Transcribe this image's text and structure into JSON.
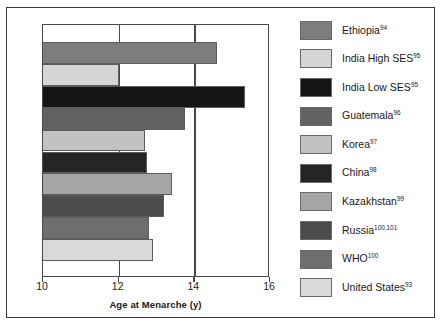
{
  "chart_data": {
    "type": "bar",
    "orientation": "horizontal",
    "title": "",
    "xlabel": "Age at Menarche (y)",
    "ylabel": "Country of Origin",
    "xlim": [
      10,
      16
    ],
    "xticks": [
      10,
      12,
      14,
      16
    ],
    "xtick_labels": [
      "10",
      "12",
      "14",
      "16"
    ],
    "grid": true,
    "grid_axis": "x",
    "legend_position": "right",
    "categories": [
      "Ethiopia",
      "India High SES",
      "India Low SES",
      "Guatemala",
      "Korea",
      "China",
      "Kazakhstan",
      "Russia",
      "WHO",
      "United States"
    ],
    "values": [
      14.6,
      12.0,
      15.35,
      13.75,
      12.7,
      12.75,
      13.4,
      13.2,
      12.8,
      12.9
    ],
    "colors": [
      "#7d7d7d",
      "#d6d6d6",
      "#151515",
      "#626262",
      "#c2c2c2",
      "#252525",
      "#a5a5a5",
      "#4c4c4c",
      "#6e6e6e",
      "#d9d9d9"
    ]
  },
  "axes": {
    "y_title": "Country of Origin",
    "x_title": "Age at Menarche (y)",
    "x_tick_labels": [
      "10",
      "12",
      "14",
      "16"
    ]
  },
  "legend": {
    "items": [
      {
        "label": "Ethiopia",
        "ref": "94",
        "color": "#7d7d7d"
      },
      {
        "label": "India High SES",
        "ref": "95",
        "color": "#d6d6d6"
      },
      {
        "label": "India Low SES",
        "ref": "95",
        "color": "#151515"
      },
      {
        "label": "Guatemala",
        "ref": "96",
        "color": "#626262"
      },
      {
        "label": "Korea",
        "ref": "97",
        "color": "#c2c2c2"
      },
      {
        "label": "China",
        "ref": "98",
        "color": "#252525"
      },
      {
        "label": "Kazakhstan",
        "ref": "99",
        "color": "#a5a5a5"
      },
      {
        "label": "Russia",
        "ref": "100,101",
        "color": "#4c4c4c"
      },
      {
        "label": "WHO",
        "ref": "100",
        "color": "#6e6e6e"
      },
      {
        "label": "United States",
        "ref": "93",
        "color": "#d9d9d9"
      }
    ]
  }
}
